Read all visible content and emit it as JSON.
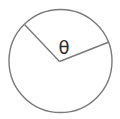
{
  "diagram": {
    "angle_label": "θ",
    "stroke_color": "#7a7a7a",
    "label_color": "#2b2b2b",
    "background": "#ffffff",
    "shapes": {
      "circle": "circle",
      "radius_lines": 2,
      "angle_label_symbol": "theta"
    }
  }
}
